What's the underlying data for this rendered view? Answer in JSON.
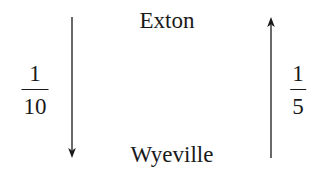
{
  "diagram": {
    "nodes": {
      "top": {
        "label": "Exton"
      },
      "bottom": {
        "label": "Wyeville"
      }
    },
    "edges": [
      {
        "from": "Exton",
        "to": "Wyeville",
        "direction": "down",
        "side": "left",
        "label": {
          "numerator": "1",
          "denominator": "10"
        }
      },
      {
        "from": "Wyeville",
        "to": "Exton",
        "direction": "up",
        "side": "right",
        "label": {
          "numerator": "1",
          "denominator": "5"
        }
      }
    ],
    "colors": {
      "ink": "#1a1a1a",
      "background": "#ffffff"
    }
  }
}
